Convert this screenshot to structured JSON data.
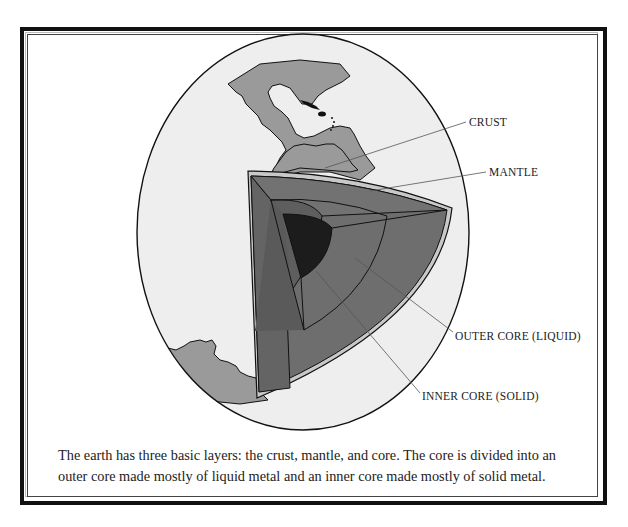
{
  "figure": {
    "labels": {
      "crust": "CRUST",
      "mantle": "MANTLE",
      "outer_core": "OUTER CORE (LIQUID)",
      "inner_core": "INNER CORE (SOLID)"
    },
    "caption": {
      "line1": "The earth has three basic layers: the crust, mantle, and core.  The core is divided into an",
      "line2": "outer core made mostly of liquid metal and an inner core made mostly of solid metal."
    },
    "colors": {
      "ocean": "#eeeeee",
      "land": "#9a9a9a",
      "crust": "#c8c8c8",
      "mantle": "#6e6e6e",
      "outer_core": "#5e5e5e",
      "inner_core": "#1c1c1c",
      "outline": "#111111",
      "leader": "#555555"
    }
  }
}
